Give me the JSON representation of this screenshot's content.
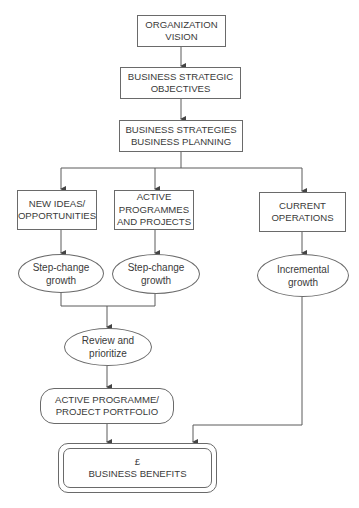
{
  "diagram": {
    "type": "flowchart",
    "nodes": {
      "org_vision": {
        "label": "ORGANIZATION\nVISION",
        "shape": "rectangle"
      },
      "strategic_objectives": {
        "label": "BUSINESS STRATEGIC\nOBJECTIVES",
        "shape": "rectangle"
      },
      "strategies_planning": {
        "label": "BUSINESS STRATEGIES\nBUSINESS PLANNING",
        "shape": "rectangle"
      },
      "new_ideas": {
        "label": "NEW IDEAS/\nOPPORTUNITIES",
        "shape": "rectangle"
      },
      "active_programmes": {
        "label": "ACTIVE\nPROGRAMMES\nAND PROJECTS",
        "shape": "rectangle"
      },
      "current_operations": {
        "label": "CURRENT\nOPERATIONS",
        "shape": "rectangle"
      },
      "step_change_1": {
        "label": "Step-change\ngrowth",
        "shape": "ellipse"
      },
      "step_change_2": {
        "label": "Step-change\ngrowth",
        "shape": "ellipse"
      },
      "incremental": {
        "label": "Incremental\ngrowth",
        "shape": "ellipse"
      },
      "review": {
        "label": "Review and\nprioritize",
        "shape": "ellipse"
      },
      "portfolio": {
        "label": "ACTIVE PROGRAMME/\nPROJECT PORTFOLIO",
        "shape": "rounded-rectangle"
      },
      "benefits": {
        "label": "£\nBUSINESS BENEFITS",
        "shape": "double-rounded-rectangle"
      }
    },
    "edges": [
      [
        "org_vision",
        "strategic_objectives"
      ],
      [
        "strategic_objectives",
        "strategies_planning"
      ],
      [
        "strategies_planning",
        "new_ideas"
      ],
      [
        "strategies_planning",
        "active_programmes"
      ],
      [
        "strategies_planning",
        "current_operations"
      ],
      [
        "new_ideas",
        "step_change_1"
      ],
      [
        "active_programmes",
        "step_change_2"
      ],
      [
        "current_operations",
        "incremental"
      ],
      [
        "step_change_1",
        "review"
      ],
      [
        "step_change_2",
        "review"
      ],
      [
        "review",
        "portfolio"
      ],
      [
        "portfolio",
        "benefits"
      ],
      [
        "incremental",
        "benefits"
      ]
    ],
    "colors": {
      "line": "#5a5a5a",
      "text": "#3a3a3a",
      "background": "#ffffff"
    }
  }
}
